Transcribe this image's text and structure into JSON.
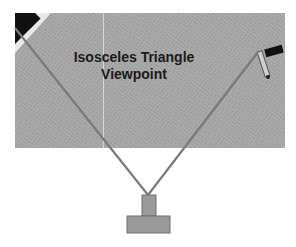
{
  "diagram": {
    "title_line1": "Isosceles Triangle",
    "title_line2": "Viewpoint",
    "colors": {
      "photo_bg": "#a9a9a9",
      "line": "#7a7a7a",
      "camera_box": "#9a9a9a",
      "camera_border": "#6e6e6e",
      "text": "#1a1a1a"
    },
    "elements": [
      {
        "name": "floor-photo",
        "description": "grayscale carpet photo"
      },
      {
        "name": "left-sight-line",
        "from": [
          15,
          30
        ],
        "to": [
          148,
          195
        ]
      },
      {
        "name": "right-sight-line",
        "from": [
          258,
          50
        ],
        "to": [
          148,
          195
        ]
      },
      {
        "name": "camera-icon",
        "description": "T-shaped viewpoint marker"
      },
      {
        "name": "handgun-object",
        "description": "object at top right of photo"
      }
    ]
  }
}
